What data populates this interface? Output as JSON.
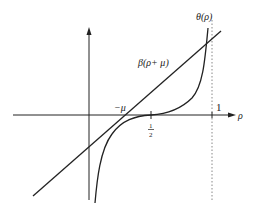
{
  "diagram": {
    "axes": {
      "x_label": "ρ",
      "tick_one": "1",
      "tick_half_num": "1",
      "tick_half_den": "2",
      "tick_neg_mu": "−μ"
    },
    "curves": {
      "theta_label": "θ(ρ)",
      "beta_label": "β(ρ+ μ)"
    },
    "colors": {
      "stroke": "#222222",
      "dotted": "#888888",
      "background": "#ffffff"
    }
  }
}
